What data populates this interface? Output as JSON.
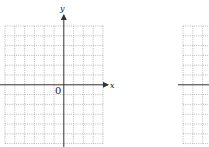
{
  "diagram": {
    "type": "coordinate-grid",
    "grids": [
      {
        "name": "left-grid",
        "x_axis_label": "x",
        "y_axis_label": "y",
        "origin_label": "0",
        "columns": 12,
        "rows": 12
      },
      {
        "name": "right-grid",
        "partially_visible": true
      }
    ],
    "colors": {
      "grid": "#8a8a8a",
      "axis": "#333333",
      "background": "#ffffff"
    }
  }
}
